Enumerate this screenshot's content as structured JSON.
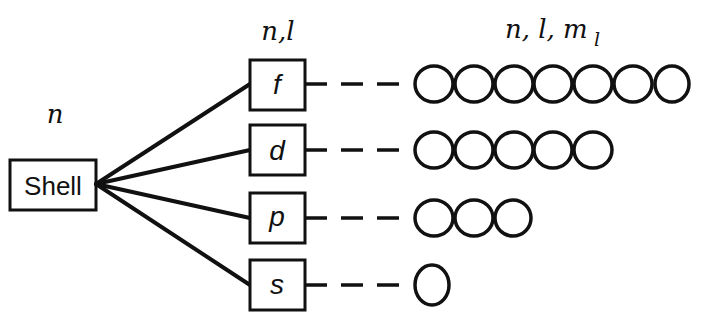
{
  "diagram": {
    "column_labels": {
      "shell": "n",
      "subshell": "n,l",
      "orbital_prefix": "n, l, m",
      "orbital_subscript": "l"
    },
    "shell_box": {
      "label": "Shell"
    },
    "subshells": [
      {
        "label": "f",
        "orbital_count": 7
      },
      {
        "label": "d",
        "orbital_count": 5
      },
      {
        "label": "p",
        "orbital_count": 3
      },
      {
        "label": "s",
        "orbital_count": 1
      }
    ],
    "colors": {
      "stroke": "#111111",
      "background": "#ffffff"
    }
  }
}
